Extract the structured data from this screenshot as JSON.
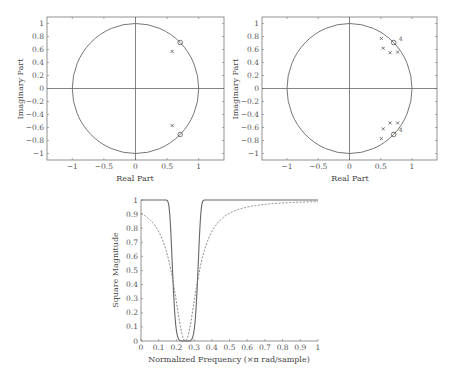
{
  "chart_data": [
    {
      "type": "scatter",
      "title": "",
      "xlabel": "Real Part",
      "ylabel": "Imaginary Part",
      "xlim": [
        -1.4,
        1.4
      ],
      "ylim": [
        -1.1,
        1.1
      ],
      "xticks": [
        -1,
        -0.5,
        0,
        0.5,
        1
      ],
      "yticks": [
        -1,
        -0.8,
        -0.6,
        -0.4,
        -0.2,
        0,
        0.2,
        0.4,
        0.6,
        0.8,
        1
      ],
      "unit_circle": true,
      "series": [
        {
          "name": "zeros",
          "marker": "o",
          "points": [
            [
              0.707,
              0.707
            ],
            [
              0.707,
              -0.707
            ]
          ]
        },
        {
          "name": "poles",
          "marker": "x",
          "points": [
            [
              0.58,
              0.57
            ],
            [
              0.58,
              -0.57
            ]
          ]
        }
      ]
    },
    {
      "type": "scatter",
      "title": "",
      "xlabel": "Real Part",
      "ylabel": "Imaginary Part",
      "xlim": [
        -1.4,
        1.4
      ],
      "ylim": [
        -1.1,
        1.1
      ],
      "xticks": [
        -1,
        -0.5,
        0,
        0.5,
        1
      ],
      "yticks": [
        -1,
        -0.8,
        -0.6,
        -0.4,
        -0.2,
        0,
        0.2,
        0.4,
        0.6,
        0.8,
        1
      ],
      "unit_circle": true,
      "series": [
        {
          "name": "zeros",
          "marker": "o",
          "points": [
            [
              0.707,
              0.707
            ],
            [
              0.707,
              -0.707
            ]
          ],
          "multiplicity": 4
        },
        {
          "name": "poles",
          "marker": "x",
          "points": [
            [
              0.51,
              0.77
            ],
            [
              0.54,
              0.62
            ],
            [
              0.65,
              0.55
            ],
            [
              0.77,
              0.56
            ],
            [
              0.51,
              -0.77
            ],
            [
              0.54,
              -0.62
            ],
            [
              0.65,
              -0.53
            ],
            [
              0.77,
              -0.53
            ]
          ]
        }
      ],
      "annotations": [
        {
          "text": "4",
          "x": 0.77,
          "y": 0.76
        },
        {
          "text": "4",
          "x": 0.77,
          "y": -0.64
        }
      ]
    },
    {
      "type": "line",
      "title": "",
      "xlabel": "Normalized Frequency (×π rad/sample)",
      "ylabel": "Square Magnitude",
      "xlim": [
        0,
        1
      ],
      "ylim": [
        0,
        1
      ],
      "xticks": [
        0,
        0.1,
        0.2,
        0.3,
        0.4,
        0.5,
        0.6,
        0.7,
        0.8,
        0.9,
        1
      ],
      "yticks": [
        0,
        0.1,
        0.2,
        0.3,
        0.4,
        0.5,
        0.6,
        0.7,
        0.8,
        0.9,
        1
      ],
      "x": [
        0,
        0.05,
        0.1,
        0.15,
        0.18,
        0.2,
        0.22,
        0.25,
        0.28,
        0.3,
        0.32,
        0.35,
        0.4,
        0.5,
        0.6,
        0.7,
        0.8,
        0.9,
        1
      ],
      "series": [
        {
          "name": "4th-order notch (solid)",
          "style": "solid",
          "values": [
            1,
            1,
            1,
            0.98,
            0.8,
            0.3,
            0.01,
            0,
            0.01,
            0.3,
            0.8,
            0.98,
            1,
            1,
            1,
            1,
            1,
            1,
            1
          ]
        },
        {
          "name": "2nd-order notch (dashed)",
          "style": "dashed",
          "values": [
            1,
            0.99,
            0.95,
            0.82,
            0.6,
            0.38,
            0.12,
            0,
            0.12,
            0.38,
            0.6,
            0.76,
            0.88,
            0.95,
            0.97,
            0.985,
            0.99,
            0.995,
            1
          ]
        }
      ]
    }
  ],
  "plots": {
    "p1": {
      "xlabel": "Real Part",
      "ylabel": "Imaginary Part"
    },
    "p2": {
      "xlabel": "Real Part",
      "ylabel": "Imaginary Part",
      "mult": "4"
    },
    "p3": {
      "xlabel": "Normalized Frequency (×π rad/sample)",
      "ylabel": "Square Magnitude"
    }
  }
}
